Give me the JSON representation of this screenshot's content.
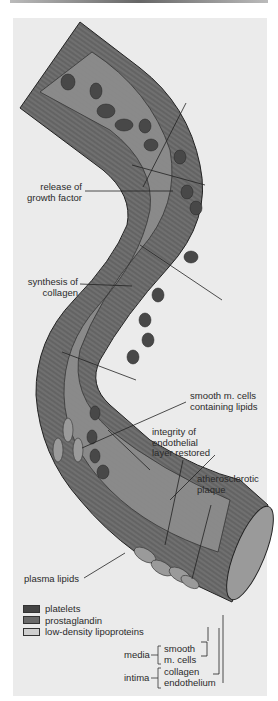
{
  "figure": {
    "type": "artery cross-section illustration",
    "colors": {
      "background": "#ebebeb",
      "vessel_wall": "#6e6e6e",
      "lumen": "#8c8c8c",
      "platelets": "#4a4a4a",
      "prostaglandin": "#5e5e5e",
      "ldl": "#c9c9c9",
      "line": "#222222"
    }
  },
  "labels": {
    "release_growth_factor": [
      "release of",
      "growth factor"
    ],
    "synthesis_collagen": [
      "synthesis of",
      "collagen"
    ],
    "smooth_cells_lipids": [
      "smooth m. cells",
      "containing lipids"
    ],
    "endothelial_restored": [
      "integrity of",
      "endothelial",
      "layer restored"
    ],
    "atherosclerotic_plaque": [
      "atherosclerotic",
      "plaque"
    ],
    "plasma_lipids": "plasma lipids"
  },
  "legend": [
    {
      "label": "platelets",
      "color": "#444444"
    },
    {
      "label": "prostaglandin",
      "color": "#6a6a6a"
    },
    {
      "label": "low-density lipoproteins",
      "color": "#cfcfcf"
    }
  ],
  "layers": {
    "media": {
      "label": "media",
      "items": [
        "smooth",
        "m. cells"
      ]
    },
    "intima": {
      "label": "intima",
      "items": [
        "collagen",
        "endothelium"
      ]
    }
  }
}
